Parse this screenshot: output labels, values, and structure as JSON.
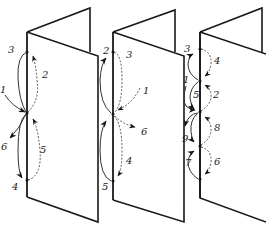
{
  "figure": {
    "panels": [
      {
        "id": "panel-1",
        "labels": [
          "1",
          "2",
          "3",
          "4",
          "5",
          "6"
        ]
      },
      {
        "id": "panel-2",
        "labels": [
          "1",
          "2",
          "3",
          "4",
          "5",
          "6"
        ]
      },
      {
        "id": "panel-3",
        "labels": [
          "1",
          "2",
          "3",
          "4",
          "5",
          "6",
          "7",
          "8",
          "9"
        ]
      }
    ]
  },
  "labels": {
    "p1": {
      "l1": "1",
      "l2": "2",
      "l3": "3",
      "l4": "4",
      "l5": "5",
      "l6": "6"
    },
    "p2": {
      "l1": "1",
      "l2": "2",
      "l3": "3",
      "l4": "4",
      "l5": "5",
      "l6": "6"
    },
    "p3": {
      "l1": "1",
      "l2": "2",
      "l3": "3",
      "l4": "4",
      "l5": "5",
      "l6": "6",
      "l7": "7",
      "l8": "8",
      "l9": "9"
    }
  },
  "colors": {
    "stroke": "#1a1a1a",
    "background": "#ffffff"
  }
}
